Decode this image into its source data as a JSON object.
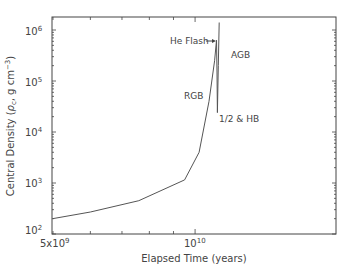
{
  "chart_data": {
    "type": "line",
    "title": "",
    "xlabel": "Elapsed Time (years)",
    "ylabel": "Central Density (ρc, g cm⁻³)",
    "xscale": "log",
    "yscale": "log",
    "xlim": [
      5000000000.0,
      20000000000.0
    ],
    "ylim": [
      90,
      1800000.0
    ],
    "x_tick_labels": [
      "5x10^9",
      "10^10"
    ],
    "y_tick_labels": [
      "10^2",
      "10^3",
      "10^4",
      "10^5",
      "10^6"
    ],
    "grid": false,
    "legend": null,
    "series": [
      {
        "name": "central density",
        "x": [
          5000000000.0,
          6000000000.0,
          7600000000.0,
          9500000000.0,
          10200000000.0,
          10700000000.0,
          11000000000.0,
          11100000000.0,
          11130000000.0,
          11150000000.0,
          11200000000.0,
          11250000000.0
        ],
        "y": [
          200,
          270,
          450,
          1150,
          4000,
          40000.0,
          250000.0,
          630000.0,
          150000.0,
          24000.0,
          200000.0,
          1400000.0
        ]
      }
    ],
    "annotations": [
      {
        "text": "He Flash",
        "arrow": true,
        "x": 11100000000.0,
        "y": 630000.0
      },
      {
        "text": "AGB",
        "x": 12000000000.0,
        "y": 300000.0
      },
      {
        "text": "RGB",
        "x": 10000000000.0,
        "y": 20000.0
      },
      {
        "text": "1/2 & HB",
        "x": 11500000000.0,
        "y": 15000.0
      }
    ]
  },
  "labels": {
    "xlabel": "Elapsed Time (years)",
    "ylabel_main": "Central Density (",
    "ylabel_rho": "ρ",
    "ylabel_sub": "c",
    "ylabel_rest": ", g cm",
    "ylabel_exp": "−3",
    "ylabel_close": ")",
    "xtick1_base": "5x10",
    "xtick1_exp": "9",
    "xtick2_base": "10",
    "xtick2_exp": "10",
    "he_flash": "He Flash",
    "agb": "AGB",
    "rgb": "RGB",
    "hb": "1/2 & HB"
  },
  "yticks": [
    {
      "base": "10",
      "exp": "2"
    },
    {
      "base": "10",
      "exp": "3"
    },
    {
      "base": "10",
      "exp": "4"
    },
    {
      "base": "10",
      "exp": "5"
    },
    {
      "base": "10",
      "exp": "6"
    }
  ]
}
